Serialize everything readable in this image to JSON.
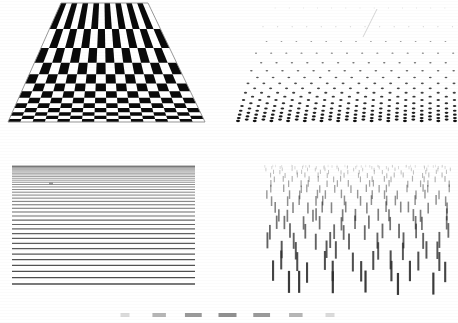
{
  "figure": {
    "background_color": "#ffffff",
    "ink_color": "#000000",
    "width": 458,
    "height": 323,
    "panel_count": 4,
    "layout": "2x2 grid with a cropped fifth strip at bottom edge"
  },
  "panels": [
    {
      "id": "checkerboard",
      "name": "Perspective Checkerboard Floor",
      "position": "top-left",
      "pattern": "checkerboard",
      "columns": 16,
      "rows": 13,
      "near_edge_y": 122,
      "far_edge_y": 3,
      "near_left_x": 8,
      "near_right_x": 205,
      "far_left_x": 61,
      "far_right_x": 148,
      "light_color": "#ffffff",
      "dark_color": "#0a0a0a",
      "outline_color": "#8c8c8c"
    },
    {
      "id": "dotgrid",
      "name": "Perspective Dot Array",
      "position": "top-right",
      "pattern": "staggered-dots",
      "rows": 22,
      "dots_per_row": 13,
      "near_edge_y": 121,
      "far_edge_y": 8,
      "near_left_x": 238,
      "near_right_x": 455,
      "far_left_x": 268,
      "far_right_x": 452,
      "dot_color": "#111111",
      "dot_min_width": 0.9,
      "dot_max_width": 4.0,
      "artifact": "faint diagonal scan streak near top-center"
    },
    {
      "id": "lines",
      "name": "Horizontal Line Density Gradient",
      "position": "bottom-left",
      "pattern": "horizontal-lines",
      "line_count": 42,
      "left_x": 12,
      "right_x": 195,
      "top_y": 166,
      "bottom_y": 284,
      "line_color": "#3d3d3d",
      "spacing": "compressed at top, expanding toward bottom",
      "artifact": "small smudge mark near x=50 y=183"
    },
    {
      "id": "strokes",
      "name": "Vertical Stroke Texture Field",
      "position": "bottom-right",
      "pattern": "vertical-strokes",
      "rows": 20,
      "strokes_per_row": 17,
      "left_x": 263,
      "right_x": 452,
      "top_y": 166,
      "bottom_y": 283,
      "stroke_color": "#2b2b2b",
      "stroke_min_length": 2.5,
      "stroke_max_length": 22,
      "stroke_min_width": 0.7,
      "stroke_max_width": 2.2
    },
    {
      "id": "cropped",
      "name": "Cropped Figure Edge",
      "position": "bottom-edge",
      "pattern": "dash-row",
      "dash_count": 7,
      "top_y": 313,
      "dash_color": "#5a5a5a",
      "note": "partially cut off by the bottom of the page"
    }
  ],
  "chart_data": {
    "type": "scatter",
    "xlabel": "",
    "ylabel": "",
    "series": [
      {
        "name": "Checkerboard rows (near-to-far band height, px)",
        "values": [
          20.5,
          17.2,
          14.4,
          12.1,
          10.1,
          8.5,
          7.1,
          5.9,
          5.0,
          4.1,
          3.5,
          2.9,
          2.4
        ]
      },
      {
        "name": "Dot array row spacing (px)",
        "values": [
          13.8,
          12.3,
          10.9,
          9.7,
          8.6,
          7.6,
          6.7,
          6.0,
          5.3,
          4.7,
          4.1,
          3.7,
          3.2,
          2.9,
          2.5,
          2.2,
          2.0,
          1.7,
          1.5,
          1.3,
          1.2,
          1.0
        ]
      },
      {
        "name": "Horizontal line spacing (px)",
        "values": [
          1.0,
          1.1,
          1.2,
          1.3,
          1.4,
          1.5,
          1.6,
          1.7,
          1.9,
          2.0,
          2.2,
          2.4,
          2.6,
          2.8,
          3.0,
          3.3,
          3.5,
          3.8,
          4.1,
          4.5,
          4.8,
          5.2,
          5.7,
          6.1,
          6.6,
          7.2,
          7.8,
          8.4,
          9.1,
          9.8
        ]
      },
      {
        "name": "Vertical stroke length (px)",
        "values": [
          2.5,
          2.9,
          3.3,
          3.8,
          4.3,
          4.9,
          5.6,
          6.4,
          7.3,
          8.3,
          9.4,
          10.6,
          12.0,
          13.4,
          15.0,
          16.6,
          18.2,
          19.8,
          21.0,
          22.0
        ]
      }
    ],
    "note": "Element size and spacing increase monotonically from the far (top) edge to the near (bottom) edge in every panel, producing a perspective texture gradient."
  }
}
